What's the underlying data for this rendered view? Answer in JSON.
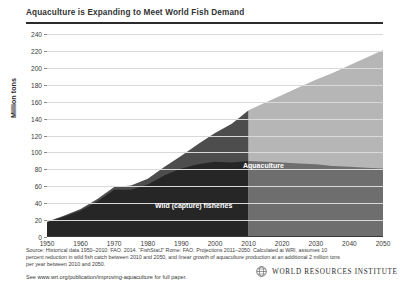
{
  "header": {
    "title": "Aquaculture is Expanding to Meet World Fish Demand"
  },
  "chart_data": {
    "type": "area",
    "stacked": true,
    "title": "Aquaculture is Expanding to Meet World Fish Demand",
    "xlabel": "",
    "ylabel": "Million tons",
    "xlim": [
      1950,
      2050
    ],
    "ylim": [
      0,
      240
    ],
    "grid": true,
    "legend_position": "in-plot",
    "yticks": [
      0,
      20,
      40,
      60,
      80,
      100,
      120,
      140,
      160,
      180,
      200,
      220,
      240
    ],
    "xticks": [
      1950,
      1960,
      1970,
      1980,
      1990,
      2000,
      2010,
      2020,
      2030,
      2040,
      2050
    ],
    "annotations": [
      {
        "text": "Aquaculture",
        "x": 2012,
        "y": 118
      },
      {
        "text": "Wild (capture) fisheries",
        "x": 1983,
        "y": 55
      }
    ],
    "projection_start": 2010,
    "colors": {
      "wild_historical": "#262626",
      "aquaculture_historical": "#4d4d4d",
      "wild_projection": "#6e6e6e",
      "aquaculture_projection": "#b6b6b6",
      "gridline": "#d9d9d9",
      "axis": "#3a3a3a"
    },
    "x": [
      1950,
      1955,
      1960,
      1965,
      1970,
      1975,
      1980,
      1985,
      1990,
      1995,
      2000,
      2005,
      2010,
      2015,
      2020,
      2025,
      2030,
      2035,
      2040,
      2045,
      2050
    ],
    "series": [
      {
        "name": "Wild (capture) fisheries",
        "values": [
          17,
          24,
          31,
          42,
          56,
          56,
          62,
          73,
          81,
          86,
          89,
          88,
          90,
          89,
          88,
          87,
          86,
          84,
          83,
          82,
          81
        ]
      },
      {
        "name": "Aquaculture",
        "values": [
          1,
          1,
          2,
          3,
          3,
          5,
          7,
          10,
          15,
          24,
          34,
          46,
          60,
          70,
          80,
          90,
          100,
          110,
          120,
          130,
          140
        ]
      }
    ],
    "totals": [
      18,
      25,
      33,
      45,
      59,
      61,
      69,
      83,
      96,
      110,
      123,
      134,
      150,
      159,
      168,
      177,
      186,
      194,
      203,
      212,
      221
    ]
  },
  "footer": {
    "source_line_1": "Source: Historical data 1950–2010: FAO. 2014. “FishStatJ” Rome: FAO. Projections 2011–2050: Calculated at WRI,",
    "source_line_2": "assumes 10 percent reduction in wild fish catch between 2010 and 2050, and linear growth of aquaculture production",
    "source_line_3": "at an additional 2 million tons per year between 2010 and 2050.",
    "see_prefix": "See ",
    "url": "www.wri.org/publication/improving-aquaculture",
    "see_suffix": " for full paper.",
    "org_name": "WORLD RESOURCES INSTITUTE"
  }
}
